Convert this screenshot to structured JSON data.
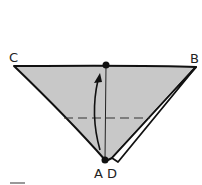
{
  "diagram": {
    "type": "origami-fold-step",
    "labels": {
      "top_left": "C",
      "top_right": "B",
      "bottom_left": "A",
      "bottom_right": "D"
    },
    "colors": {
      "paper_fill": "#c8c8c8",
      "stroke": "#111111",
      "background": "#ffffff",
      "flap_fill": "#ffffff"
    },
    "elements": {
      "fold_line": "dashed horizontal valley line",
      "arrow": "curved arrow from bottom point up to top edge",
      "points": [
        "top-center dot",
        "bottom dot"
      ]
    }
  }
}
